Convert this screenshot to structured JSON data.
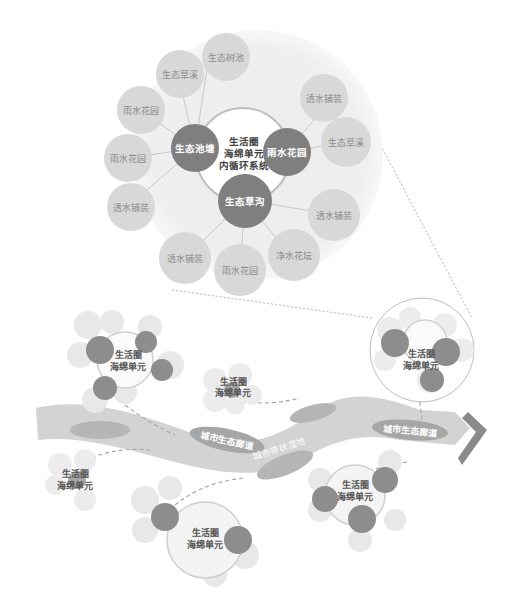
{
  "colors": {
    "halo": "#efefef",
    "satellite": "#d8d8d8",
    "satellite_text": "#8a8a8a",
    "core": "#7f7f7f",
    "core_text": "#ffffff",
    "center_text": "#444444",
    "river": "#cfcfcf",
    "ellipse": "#a6a6a6",
    "petal": "#e6e6e6",
    "petal_dark": "#c8c8c8",
    "arrow": "#9a9a9a"
  },
  "zoom_diagram": {
    "center_label": [
      "生活圈",
      "海绵单元",
      "内循环系统"
    ],
    "cores": [
      {
        "label": "生态池塘"
      },
      {
        "label": "雨水花园"
      },
      {
        "label": "生态草沟"
      }
    ],
    "satellites": [
      {
        "label": "生态树池"
      },
      {
        "label": "生态草溪"
      },
      {
        "label": "雨水花园"
      },
      {
        "label": "雨水花园"
      },
      {
        "label": "透水铺装"
      },
      {
        "label": "透水铺装"
      },
      {
        "label": "雨水花园"
      },
      {
        "label": "净水花坛"
      },
      {
        "label": "透水铺装"
      },
      {
        "label": "生态草溪"
      },
      {
        "label": "透水铺装"
      }
    ]
  },
  "map": {
    "river_labels": [
      "城市生态廊道",
      "城市带状湿地",
      "城市生态廊道"
    ],
    "units": [
      {
        "label": [
          "生活圈",
          "海绵单元"
        ]
      },
      {
        "label": [
          "生活圈",
          "海绵单元"
        ]
      },
      {
        "label": [
          "生活圈",
          "海绵单元"
        ]
      },
      {
        "label": [
          "生活圈",
          "海绵单元"
        ]
      },
      {
        "label": [
          "生活圈",
          "海绵单元"
        ]
      },
      {
        "label": [
          "生活圈",
          "海绵单元"
        ]
      }
    ]
  }
}
